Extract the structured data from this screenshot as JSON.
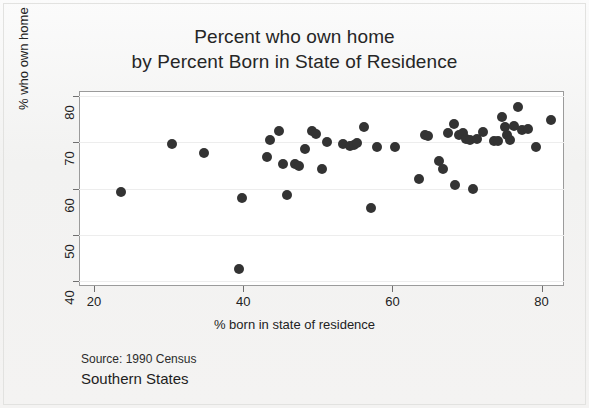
{
  "chart_data": {
    "type": "scatter",
    "title": "Percent who own home by Percent Born in State of Residence",
    "title_lines": [
      "Percent who own home",
      "by Percent Born in State of Residence"
    ],
    "xlabel": "% born in state of residence",
    "ylabel": "% who own home",
    "xlim": [
      18,
      83
    ],
    "ylim": [
      39,
      81
    ],
    "xticks": [
      20,
      40,
      60,
      80
    ],
    "yticks": [
      40,
      50,
      60,
      70,
      80
    ],
    "grid": "horizontal-faint",
    "legend": "none",
    "marker_color": "#333333",
    "plot_background": "#ffffff",
    "page_background": "#f4f3f2",
    "source": "Source: 1990 Census",
    "subtitle": "Southern States",
    "n_points": 52,
    "points": [
      {
        "x": 23.6,
        "y": 59.3
      },
      {
        "x": 30.4,
        "y": 69.6
      },
      {
        "x": 34.8,
        "y": 67.7
      },
      {
        "x": 39.4,
        "y": 42.6
      },
      {
        "x": 39.8,
        "y": 58.0
      },
      {
        "x": 43.2,
        "y": 66.7
      },
      {
        "x": 43.6,
        "y": 70.4
      },
      {
        "x": 44.8,
        "y": 72.5
      },
      {
        "x": 45.3,
        "y": 65.2
      },
      {
        "x": 45.9,
        "y": 58.6
      },
      {
        "x": 46.9,
        "y": 65.3
      },
      {
        "x": 47.5,
        "y": 64.8
      },
      {
        "x": 48.3,
        "y": 68.5
      },
      {
        "x": 49.2,
        "y": 72.3
      },
      {
        "x": 49.8,
        "y": 71.7
      },
      {
        "x": 50.6,
        "y": 64.3
      },
      {
        "x": 51.2,
        "y": 70.0
      },
      {
        "x": 53.4,
        "y": 69.6
      },
      {
        "x": 54.3,
        "y": 69.2
      },
      {
        "x": 54.8,
        "y": 69.3
      },
      {
        "x": 55.3,
        "y": 69.9
      },
      {
        "x": 56.2,
        "y": 73.2
      },
      {
        "x": 57.1,
        "y": 55.9
      },
      {
        "x": 57.9,
        "y": 68.9
      },
      {
        "x": 60.3,
        "y": 68.9
      },
      {
        "x": 63.6,
        "y": 62.0
      },
      {
        "x": 64.3,
        "y": 71.5
      },
      {
        "x": 64.8,
        "y": 71.3
      },
      {
        "x": 66.3,
        "y": 65.9
      },
      {
        "x": 66.8,
        "y": 64.3
      },
      {
        "x": 67.4,
        "y": 71.9
      },
      {
        "x": 68.2,
        "y": 74.0
      },
      {
        "x": 68.4,
        "y": 60.8
      },
      {
        "x": 68.9,
        "y": 71.5
      },
      {
        "x": 69.5,
        "y": 71.9
      },
      {
        "x": 69.9,
        "y": 70.6
      },
      {
        "x": 70.4,
        "y": 70.4
      },
      {
        "x": 70.8,
        "y": 59.8
      },
      {
        "x": 71.3,
        "y": 70.6
      },
      {
        "x": 72.1,
        "y": 72.2
      },
      {
        "x": 73.6,
        "y": 70.3
      },
      {
        "x": 74.2,
        "y": 70.2
      },
      {
        "x": 74.7,
        "y": 75.4
      },
      {
        "x": 75.1,
        "y": 73.2
      },
      {
        "x": 75.4,
        "y": 71.6
      },
      {
        "x": 75.8,
        "y": 70.5
      },
      {
        "x": 76.3,
        "y": 73.5
      },
      {
        "x": 76.8,
        "y": 77.6
      },
      {
        "x": 77.4,
        "y": 72.6
      },
      {
        "x": 78.2,
        "y": 72.8
      },
      {
        "x": 79.3,
        "y": 68.9
      },
      {
        "x": 81.2,
        "y": 74.8
      }
    ]
  }
}
